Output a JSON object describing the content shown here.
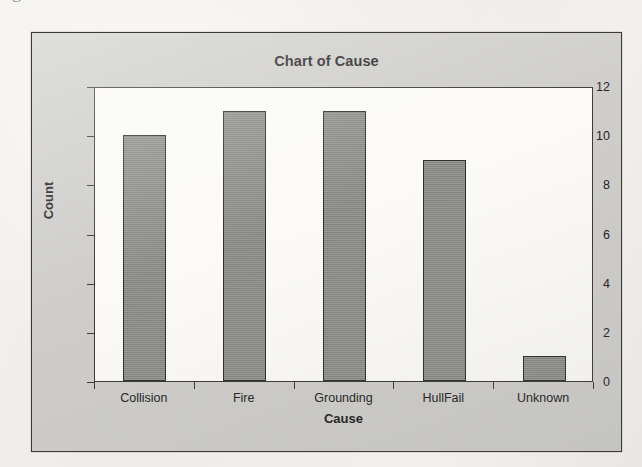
{
  "page": {
    "cut_off_line_above": "g",
    "background_color": "#f1efec"
  },
  "chart_panel": {
    "panel_color": "#cecdca",
    "plot_color": "#fbfaf8",
    "border_color": "#3b3a38",
    "bar_color": "#8b8b89"
  },
  "chart_data": {
    "type": "bar",
    "title": "Chart of Cause",
    "xlabel": "Cause",
    "ylabel": "Count",
    "categories": [
      "Collision",
      "Fire",
      "Grounding",
      "HullFail",
      "Unknown"
    ],
    "values": [
      10,
      11,
      11,
      9,
      1
    ],
    "ylim": [
      0,
      12
    ],
    "yticks": [
      0,
      2,
      4,
      6,
      8,
      10,
      12
    ],
    "ytick_labels": [
      "0",
      "2",
      "4",
      "6",
      "8",
      "10",
      "12"
    ],
    "grid": false,
    "legend": null
  }
}
